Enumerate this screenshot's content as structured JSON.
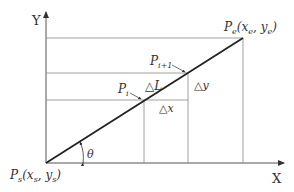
{
  "diagram": {
    "axes": {
      "x_label": "X",
      "y_label": "Y"
    },
    "points": {
      "start": {
        "name": "P",
        "sub": "s",
        "coords": "(x",
        "xsub": "s",
        "sep": ", y",
        "ysub": "s",
        "close": ")"
      },
      "end": {
        "name": "P",
        "sub": "e",
        "coords": "(x",
        "xsub": "e",
        "sep": ", y",
        "ysub": "e",
        "close": ")"
      },
      "pi": {
        "name": "P",
        "sub": "i"
      },
      "pi1": {
        "name": "P",
        "sub": "i+1"
      }
    },
    "increments": {
      "dL": "△L",
      "dx": "△x",
      "dy": "△y"
    },
    "angle": "θ",
    "colors": {
      "line": "#222222",
      "grid": "#888888",
      "text": "#333333"
    }
  }
}
